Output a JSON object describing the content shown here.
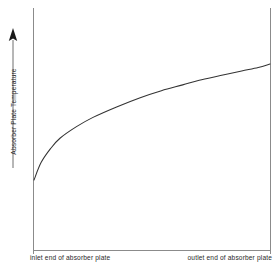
{
  "chart_data": {
    "type": "line",
    "title": "",
    "subtitle": "",
    "xlabel": "",
    "ylabel": "Absorber Plate Temperature",
    "x_end_labels": {
      "left": "inlet end of absorber plate",
      "right": "outlet end of absorber plate"
    },
    "axis": {
      "y_tick_labels": [],
      "x_tick_labels": [],
      "grid": false,
      "legend": null,
      "y_direction_arrow": "up",
      "xlim_note": "inlet-to-outlet position along absorber plate (unitless)",
      "ylim_note": "absorber plate temperature (unitless, increasing upward)"
    },
    "series": [
      {
        "name": "Absorber Plate Temperature",
        "color": "#333333",
        "shape": "concave-down rising curve, steep near inlet then flattening toward outlet",
        "x": [
          0.0,
          0.03,
          0.07,
          0.11,
          0.18,
          0.25,
          0.35,
          0.45,
          0.54,
          0.63,
          0.7,
          0.79,
          0.88,
          0.95,
          1.0
        ],
        "y": [
          0.0,
          0.15,
          0.27,
          0.36,
          0.46,
          0.54,
          0.63,
          0.71,
          0.77,
          0.82,
          0.86,
          0.9,
          0.94,
          0.97,
          1.0
        ]
      }
    ]
  },
  "figure": {
    "background_color": "#ffffff",
    "axis_color": "#8b8b8b",
    "curve_color": "#333333",
    "text_color": "#2a2a2a"
  }
}
